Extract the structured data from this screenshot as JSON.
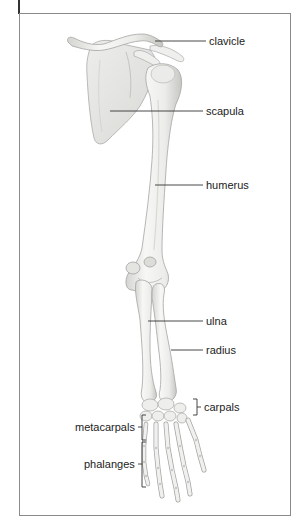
{
  "diagram": {
    "type": "anatomical-illustration",
    "labels": {
      "clavicle": "clavicle",
      "scapula": "scapula",
      "humerus": "humerus",
      "ulna": "ulna",
      "radius": "radius",
      "carpals": "carpals",
      "metacarpals": "metacarpals",
      "phalanges": "phalanges"
    },
    "colors": {
      "frame": "#8a8a8a",
      "bone_fill": "#f2f2f0",
      "bone_shade": "#c9c9c6",
      "bone_outline": "#a8a8a5",
      "leader_line": "#333333",
      "label_text": "#222222"
    }
  }
}
